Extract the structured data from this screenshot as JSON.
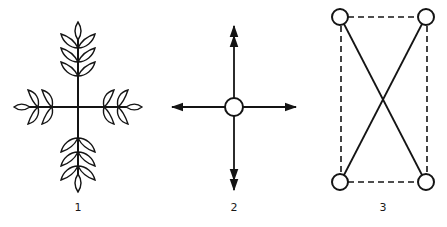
{
  "figures": [
    {
      "id": "fig1",
      "label": "1",
      "description": "Plant-like cross: four leafy branches radiating from a center point",
      "center": [
        78,
        107
      ]
    },
    {
      "id": "fig2",
      "label": "2",
      "description": "Circle with four arrows pointing up, down, left, right",
      "center": [
        234,
        107
      ]
    },
    {
      "id": "fig3",
      "label": "3",
      "description": "Four circles at corners of a dashed rectangle, connected by two solid crossing diagonals",
      "nodes": [
        [
          340,
          17
        ],
        [
          426,
          17
        ],
        [
          340,
          182
        ],
        [
          426,
          182
        ]
      ]
    }
  ],
  "colors": {
    "ink": "#141414",
    "background": "#ffffff"
  }
}
